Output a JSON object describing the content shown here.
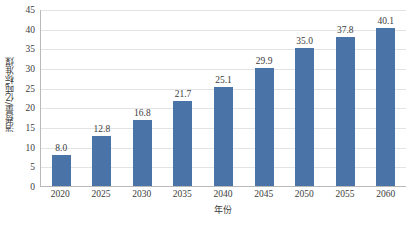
{
  "chart_data": {
    "type": "bar",
    "title": "",
    "xlabel": "年份",
    "ylabel": "消费量/亿吨标准煤",
    "categories": [
      "2020",
      "2025",
      "2030",
      "2035",
      "2040",
      "2045",
      "2050",
      "2055",
      "2060"
    ],
    "values": [
      8.0,
      12.8,
      16.8,
      21.7,
      25.1,
      29.9,
      35.0,
      37.8,
      40.1
    ],
    "value_labels": [
      "8.0",
      "12.8",
      "16.8",
      "21.7",
      "25.1",
      "29.9",
      "35.0",
      "37.8",
      "40.1"
    ],
    "ylim": [
      0,
      45
    ],
    "ytick_step": 5,
    "yticks": [
      0,
      5,
      10,
      15,
      20,
      25,
      30,
      35,
      40,
      45
    ],
    "ytick_labels": [
      "0",
      "5",
      "10",
      "15",
      "20",
      "25",
      "30",
      "35",
      "40",
      "45"
    ],
    "grid": true,
    "grid_axis": "y",
    "legend": false,
    "legend_position": "none",
    "series": [
      {
        "name": "消费量",
        "color": "#4a74a8",
        "values": [
          8.0,
          12.8,
          16.8,
          21.7,
          25.1,
          29.9,
          35.0,
          37.8,
          40.1
        ]
      }
    ]
  },
  "colors": {
    "bar": "#4a74a8",
    "gridline": "#e3e3e3",
    "axis": "#b9b9b9",
    "text": "#3c3c3c",
    "background": "#ffffff"
  }
}
